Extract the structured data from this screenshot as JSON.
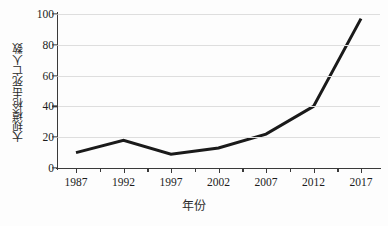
{
  "chart_data": {
    "type": "line",
    "title": "",
    "subtitle": "",
    "xlabel": "年份",
    "ylabel": "大规模枪击死亡人数",
    "x": [
      1987,
      1992,
      1997,
      2002,
      2007,
      2012,
      2017
    ],
    "categories": [
      "1987",
      "1992",
      "1997",
      "2002",
      "2007",
      "2012",
      "2017"
    ],
    "values": [
      10,
      18,
      9,
      13,
      22,
      40,
      97
    ],
    "series": [
      {
        "name": "大规模枪击死亡人数",
        "values": [
          10,
          18,
          9,
          13,
          22,
          40,
          97
        ]
      }
    ],
    "xlim": [
      1985,
      2019
    ],
    "ylim": [
      0,
      100
    ],
    "xticks": [
      "1987",
      "1992",
      "1997",
      "2002",
      "2007",
      "2012",
      "2017"
    ],
    "yticks": [
      "0",
      "20",
      "40",
      "60",
      "80",
      "100"
    ],
    "ytick_values": [
      0,
      20,
      40,
      60,
      80,
      100
    ],
    "grid": "horizontal",
    "legend": "none",
    "line_color": "#1a1a1a",
    "line_width": 3,
    "grid_color": "#dedede",
    "axis_color": "#3a3a3a",
    "background_color": "#fdfdfd",
    "annotations": []
  }
}
